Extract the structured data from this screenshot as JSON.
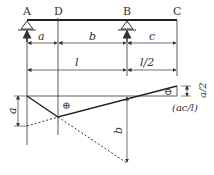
{
  "points": {
    "A": "A",
    "D": "D",
    "B": "B",
    "C": "C"
  },
  "dimensions": {
    "row1": {
      "a": "a",
      "b": "b",
      "c": "c"
    },
    "row2": {
      "l": "l",
      "l_half": "l/2"
    }
  },
  "influence_line": {
    "positive_sign": "⊕",
    "negative_sign": "⊖",
    "left_ordinate": "a",
    "right_ordinate": "b",
    "end_ordinate": "a/2",
    "end_value": "(ac/l)"
  },
  "colors": {
    "line": "#333333",
    "background": "#ffffff"
  }
}
